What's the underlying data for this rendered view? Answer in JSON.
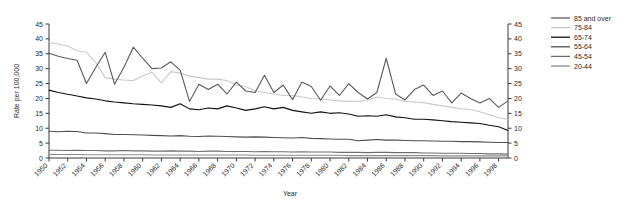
{
  "chart_data": {
    "type": "line",
    "title": "",
    "xlabel": "Year",
    "ylabel": "Rate per 100,000",
    "ylim": [
      0,
      45
    ],
    "ytick_values": [
      0,
      5,
      10,
      15,
      20,
      25,
      30,
      35,
      40,
      45
    ],
    "right_axis": true,
    "right_ytick_values": [
      0,
      5,
      10,
      15,
      20,
      25,
      30,
      35,
      40,
      45
    ],
    "grid": false,
    "legend_position": "right",
    "x": [
      1950,
      1951,
      1952,
      1953,
      1954,
      1955,
      1956,
      1957,
      1958,
      1959,
      1960,
      1961,
      1962,
      1963,
      1964,
      1965,
      1966,
      1967,
      1968,
      1969,
      1970,
      1971,
      1972,
      1973,
      1974,
      1975,
      1976,
      1977,
      1978,
      1979,
      1980,
      1981,
      1982,
      1983,
      1984,
      1985,
      1986,
      1987,
      1988,
      1989,
      1990,
      1991,
      1992,
      1993,
      1994,
      1995,
      1996,
      1997,
      1998,
      1999
    ],
    "xtick_labels": [
      "1950",
      "1952",
      "1954",
      "1956",
      "1958",
      "1960",
      "1962",
      "1964",
      "1966",
      "1968",
      "1970",
      "1972",
      "1974",
      "1976",
      "1978",
      "1980",
      "1982",
      "1984",
      "1986",
      "1988",
      "1990",
      "1992",
      "1994",
      "1996",
      "1998"
    ],
    "series": [
      {
        "name": "85 and over",
        "color": "#5a5a5a",
        "values": [
          35.2,
          34.2,
          33.4,
          32.8,
          25.0,
          30.5,
          35.5,
          24.8,
          30.5,
          37.2,
          33.5,
          30.0,
          30.2,
          32.3,
          29.5,
          19.0,
          24.8,
          23.0,
          24.8,
          21.5,
          25.5,
          22.5,
          22.0,
          27.8,
          22.0,
          24.5,
          19.6,
          25.5,
          24.0,
          19.4,
          24.2,
          21.0,
          25.0,
          22.0,
          19.8,
          22.0,
          33.5,
          21.5,
          19.5,
          23.0,
          24.5,
          21.0,
          22.5,
          18.5,
          21.8,
          20.0,
          18.5,
          20.0,
          17.0,
          19.2
        ]
      },
      {
        "name": "75-84",
        "color": "#c9c9c9",
        "values": [
          38.8,
          38.3,
          37.6,
          36.0,
          35.5,
          32.0,
          27.0,
          26.5,
          26.2,
          26.0,
          27.5,
          28.8,
          25.2,
          29.0,
          28.5,
          27.5,
          27.0,
          26.5,
          26.5,
          26.0,
          24.5,
          24.0,
          22.5,
          22.0,
          21.5,
          21.0,
          21.0,
          20.5,
          20.0,
          19.8,
          19.5,
          19.2,
          19.0,
          19.0,
          19.5,
          20.5,
          20.0,
          19.8,
          19.0,
          18.8,
          18.6,
          18.0,
          17.5,
          17.0,
          16.5,
          16.3,
          15.5,
          14.5,
          13.5,
          13.0
        ]
      },
      {
        "name": "65-74",
        "color": "#111111",
        "values": [
          22.8,
          22.0,
          21.4,
          20.8,
          20.2,
          19.8,
          19.2,
          18.8,
          18.5,
          18.2,
          18.0,
          17.8,
          17.5,
          17.0,
          18.2,
          16.5,
          16.2,
          16.8,
          16.5,
          17.5,
          16.8,
          16.0,
          16.5,
          17.2,
          16.5,
          17.0,
          16.0,
          15.5,
          15.0,
          15.5,
          15.0,
          15.2,
          14.8,
          14.0,
          14.2,
          14.0,
          14.5,
          13.8,
          13.5,
          13.0,
          13.0,
          12.8,
          12.5,
          12.2,
          12.0,
          11.8,
          11.6,
          11.0,
          10.5,
          9.2
        ]
      },
      {
        "name": "55-64",
        "color": "#4f4f4f",
        "values": [
          9.0,
          8.8,
          9.0,
          8.9,
          8.4,
          8.4,
          8.2,
          7.9,
          7.9,
          7.8,
          7.7,
          7.6,
          7.5,
          7.4,
          7.5,
          7.3,
          7.2,
          7.4,
          7.3,
          7.2,
          7.1,
          7.0,
          7.1,
          7.0,
          6.9,
          6.8,
          6.7,
          6.9,
          6.6,
          6.5,
          6.4,
          6.3,
          6.3,
          5.8,
          6.0,
          6.2,
          6.0,
          6.0,
          5.9,
          5.8,
          5.8,
          5.7,
          5.6,
          5.6,
          5.5,
          5.5,
          5.4,
          5.3,
          5.2,
          5.2
        ]
      },
      {
        "name": "45-54",
        "color": "#6e6e6e",
        "values": [
          2.6,
          2.6,
          2.5,
          2.6,
          2.5,
          2.5,
          2.4,
          2.4,
          2.5,
          2.4,
          2.4,
          2.3,
          2.3,
          2.4,
          2.3,
          2.3,
          2.2,
          2.3,
          2.3,
          2.2,
          2.2,
          2.2,
          2.1,
          2.2,
          2.1,
          2.1,
          2.0,
          2.1,
          2.0,
          2.0,
          2.0,
          1.9,
          1.9,
          1.9,
          1.8,
          1.9,
          1.9,
          1.8,
          1.8,
          1.8,
          1.7,
          1.7,
          1.6,
          1.6,
          1.6,
          1.5,
          1.5,
          1.4,
          1.4,
          1.3
        ]
      },
      {
        "name": "20-44",
        "color": "#8a8a8a",
        "values": [
          1.2,
          1.2,
          1.2,
          1.2,
          1.1,
          1.1,
          1.1,
          1.1,
          1.1,
          1.1,
          1.1,
          1.0,
          1.0,
          1.0,
          1.0,
          1.0,
          1.0,
          1.0,
          1.0,
          1.0,
          1.0,
          1.0,
          0.9,
          0.9,
          0.9,
          0.9,
          0.9,
          0.9,
          0.9,
          0.9,
          0.9,
          0.9,
          0.8,
          0.8,
          0.8,
          0.8,
          0.8,
          0.8,
          0.8,
          0.8,
          0.8,
          0.8,
          0.7,
          0.7,
          0.7,
          0.7,
          0.7,
          0.7,
          0.7,
          0.7
        ]
      }
    ]
  },
  "legend": {
    "entries": [
      {
        "label": "85 and over"
      },
      {
        "label": "75-84"
      },
      {
        "label": "65-74"
      },
      {
        "label": "55-64"
      },
      {
        "label": "45-54"
      },
      {
        "label": "20-44"
      }
    ]
  }
}
